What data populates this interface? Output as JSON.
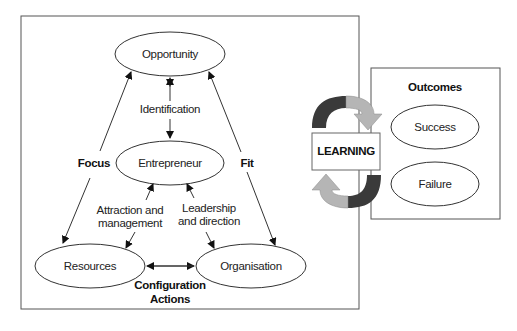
{
  "diagram": {
    "nodes": {
      "opportunity": "Opportunity",
      "entrepreneur": "Entrepreneur",
      "resources": "Resources",
      "organisation": "Organisation",
      "learning": "LEARNING",
      "success": "Success",
      "failure": "Failure"
    },
    "edge_labels": {
      "identification": "Identification",
      "focus": "Focus",
      "fit": "Fit",
      "attraction_line1": "Attraction and",
      "attraction_line2": "management",
      "leadership_line1": "Leadership",
      "leadership_line2": "and direction",
      "configuration_line1": "Configuration",
      "configuration_line2": "Actions"
    },
    "outcomes_title": "Outcomes",
    "colors": {
      "line": "#333333",
      "arrow_dark": "#3a3a3a",
      "arrow_light": "#b5b5b5"
    }
  }
}
